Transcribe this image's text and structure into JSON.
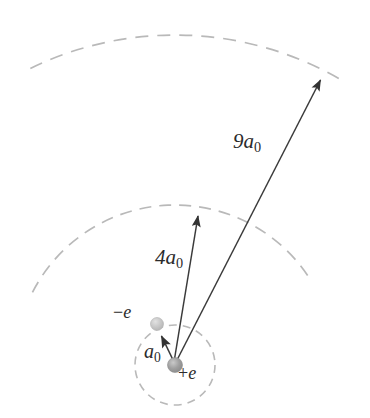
{
  "figure": {
    "background_color": "#ffffff",
    "width": 370,
    "height": 418
  },
  "colors": {
    "arc_stroke": "#b9b9b9",
    "arrow_stroke": "#3a3a3a",
    "nucleus_fill": "#9a9a9a",
    "electron_fill": "#c2c2c2",
    "label_color": "#2b2b2b"
  },
  "nucleus": {
    "label_sign": "+",
    "label_symbol": "e",
    "center_x": 175,
    "center_y": 365,
    "radius": 7.5
  },
  "electron": {
    "label_sign": "−",
    "label_symbol": "e",
    "center_x": 157,
    "center_y": 324,
    "radius": 6.5
  },
  "orbits": [
    {
      "name": "ground-state-orbit",
      "label_coefficient": "",
      "label_symbol": "a",
      "label_subscript": "0",
      "label_text": "a0",
      "radius_px": 40,
      "shape": "full-circle",
      "dashed": true
    },
    {
      "name": "n2-orbit",
      "label_coefficient": "4",
      "label_symbol": "a",
      "label_subscript": "0",
      "label_text": "4a0",
      "radius_px": 160,
      "shape": "arc",
      "dashed": true
    },
    {
      "name": "n3-orbit",
      "label_coefficient": "9",
      "label_symbol": "a",
      "label_subscript": "0",
      "label_text": "9a0",
      "radius_px": 330,
      "shape": "arc",
      "dashed": true
    }
  ],
  "radius_arrows": [
    {
      "name": "a0-radius-arrow",
      "from_x": 175,
      "from_y": 365,
      "to_x": 160,
      "to_y": 332,
      "label": "a0"
    },
    {
      "name": "4a0-radius-arrow",
      "from_x": 175,
      "from_y": 365,
      "to_x": 199,
      "to_y": 211,
      "label": "4a0"
    },
    {
      "name": "9a0-radius-arrow",
      "from_x": 175,
      "from_y": 365,
      "to_x": 323,
      "to_y": 76,
      "label": "9a0"
    }
  ],
  "labels": {
    "nine_a0_coefficient": "9",
    "nine_a0_symbol": "a",
    "nine_a0_subscript": "0",
    "four_a0_coefficient": "4",
    "four_a0_symbol": "a",
    "four_a0_subscript": "0",
    "a0_symbol": "a",
    "a0_subscript": "0",
    "minus_e_sign": "−",
    "minus_e_symbol": "e",
    "plus_e_sign": "+",
    "plus_e_symbol": "e"
  }
}
